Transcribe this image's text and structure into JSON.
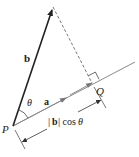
{
  "diagram": {
    "labels": {
      "b": "b",
      "a": "a",
      "theta": "θ",
      "P": "P",
      "Q": "Q",
      "projection_bar_left": "|",
      "projection_b": "b",
      "projection_bar_right": "|",
      "projection_cos": " cos ",
      "projection_theta": "θ"
    },
    "colors": {
      "vector_b": "#222222",
      "line_a": "#7a7a7a",
      "dashed": "#555555",
      "text": "#222222"
    },
    "points": {
      "P": [
        13,
        126
      ],
      "b_tip": [
        53,
        7
      ],
      "Q": [
        92,
        83
      ],
      "a_end": [
        135,
        62
      ]
    }
  }
}
